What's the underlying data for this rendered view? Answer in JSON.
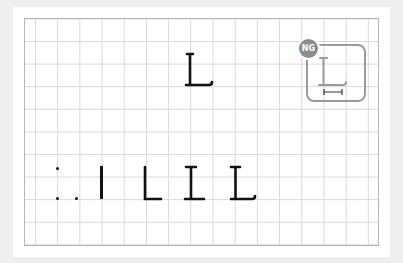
{
  "example": {
    "target_letter": "L",
    "badge": "NG",
    "ng_letter": "L",
    "stroke_sequence": [
      ":",
      ".",
      "|",
      "L",
      "I",
      "L"
    ]
  },
  "colors": {
    "background": "#efefef",
    "grid_line": "#d8d8d8",
    "ink": "#111111",
    "ng_gray": "#9a9a9a"
  }
}
